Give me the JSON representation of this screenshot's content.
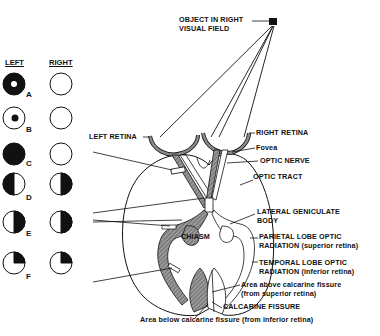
{
  "object": {
    "label_line1": "OBJECT IN RIGHT",
    "label_line2": "VISUAL FIELD"
  },
  "legend": {
    "header_left": "LEFT",
    "header_right": "RIGHT",
    "rows": [
      {
        "letter": "A",
        "left": "ring-with-white-center",
        "right": "empty"
      },
      {
        "letter": "B",
        "left": "central-black-dot",
        "right": "empty"
      },
      {
        "letter": "C",
        "left": "full-black",
        "right": "empty"
      },
      {
        "letter": "D",
        "left": "left-half-black",
        "right": "right-half-black"
      },
      {
        "letter": "E",
        "left": "right-half-black",
        "right": "right-half-black"
      },
      {
        "letter": "F",
        "left": "upper-right-quadrant-black",
        "right": "upper-right-quadrant-black"
      }
    ]
  },
  "labels": {
    "left_retina": "LEFT RETINA",
    "right_retina": "RIGHT RETINA",
    "fovea": "Fovea",
    "optic_nerve": "OPTIC NERVE",
    "optic_tract": "OPTIC TRACT",
    "lgb_line1": "LATERAL GENICULATE",
    "lgb_line2": "BODY",
    "chiasm": "CHIASM",
    "parietal_line1": "PARIETAL LOBE OPTIC",
    "parietal_line2": "RADIATION (superior retina)",
    "temporal_line1": "TEMPORAL LOBE OPTIC",
    "temporal_line2": "RADIATION (inferior retina)",
    "above_line1": "Area above calcarine fissure",
    "above_line2": "(from superior retina)",
    "calcarine": "CALCARINE FISSURE",
    "below": "Area below calcarine fissure (from inferior retina)"
  }
}
